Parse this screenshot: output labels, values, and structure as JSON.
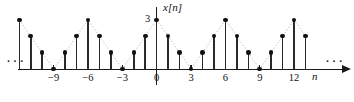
{
  "figure": {
    "kind": "discrete-time-signal-stem-plot",
    "background_color": "#ffffff",
    "ink_color": "#111111",
    "ylabel": "x[n]",
    "ylabel_var": "x",
    "ylabel_index": "[n]",
    "xlabel": "n",
    "y_value_label": "3",
    "ellipsis_left": "···",
    "ellipsis_right": "···",
    "x_tick_labels": [
      {
        "n": -9,
        "text": "−9"
      },
      {
        "n": -6,
        "text": "−6"
      },
      {
        "n": -3,
        "text": "−3"
      },
      {
        "n": 0,
        "text": "0"
      },
      {
        "n": 3,
        "text": "3"
      },
      {
        "n": 6,
        "text": "6"
      },
      {
        "n": 9,
        "text": "9"
      },
      {
        "n": 12,
        "text": "12"
      }
    ]
  },
  "chart_data": {
    "type": "line",
    "subtype": "stem",
    "title": "",
    "xlabel": "n",
    "ylabel": "x[n]",
    "xlim": [
      -12,
      14
    ],
    "ylim": [
      0,
      3
    ],
    "grid": false,
    "legend": null,
    "period": 6,
    "x": [
      -12,
      -11,
      -10,
      -9,
      -8,
      -7,
      -6,
      -5,
      -4,
      -3,
      -2,
      -1,
      0,
      1,
      2,
      3,
      4,
      5,
      6,
      7,
      8,
      9,
      10,
      11,
      12,
      13
    ],
    "values": [
      3,
      2,
      1,
      0,
      1,
      2,
      3,
      2,
      1,
      0,
      1,
      2,
      3,
      2,
      1,
      0,
      1,
      2,
      3,
      2,
      1,
      0,
      1,
      2,
      3,
      2
    ],
    "tick_positions": [
      -9,
      -6,
      -3,
      0,
      3,
      6,
      9,
      12
    ],
    "tick_labels": [
      "−9",
      "−6",
      "−3",
      "0",
      "3",
      "6",
      "9",
      "12"
    ],
    "y_tick_positions": [
      3
    ],
    "y_tick_labels": [
      "3"
    ],
    "annotations": [
      {
        "text": "···",
        "position": "left-of-axis",
        "meaning": "sequence continues"
      },
      {
        "text": "···",
        "position": "right-of-axis",
        "meaning": "sequence continues"
      }
    ]
  }
}
